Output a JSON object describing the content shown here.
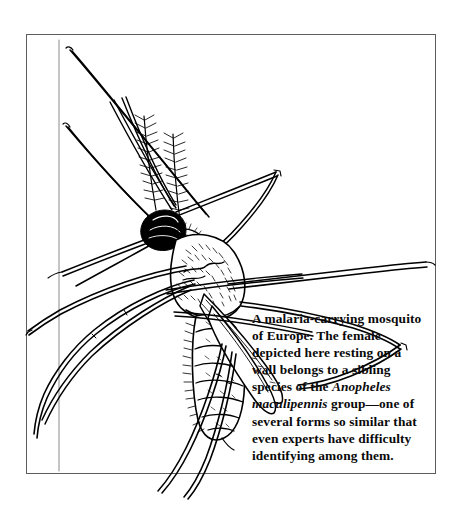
{
  "figure": {
    "name": "mosquito-illustration-plate",
    "medium": "pen-and-ink line drawing",
    "background_color": "#ffffff",
    "ink_color": "#000000",
    "frame_color": "#5d5d5d"
  },
  "caption": {
    "segments": [
      {
        "text": "A malaria-carrying mosquito of Europe. The female depicted here resting on a wall belongs to a sibling species of the ",
        "style": "roman"
      },
      {
        "text": "Anopheles maculipennis",
        "style": "italic"
      },
      {
        "text": " group—one of several forms so similar that even experts have difficulty identifying among them.",
        "style": "roman"
      }
    ],
    "full_text": "A malaria-carrying mosquito of Europe. The female depicted here resting on a wall belongs to a sibling species of the Anopheles maculipennis group—one of several forms so similar that even experts have difficulty identifying among them.",
    "lines": [
      "A malaria-carrying mosquito",
      "of Europe. The female",
      "depicted here resting on a",
      "wall belongs to a sibling spe-",
      "cies of the Anopheles maculi-",
      "pennis group—one of several",
      "forms so similar that even",
      "experts have difficulty identi-",
      "fying among them."
    ],
    "scientific_name": "Anopheles maculipennis"
  }
}
